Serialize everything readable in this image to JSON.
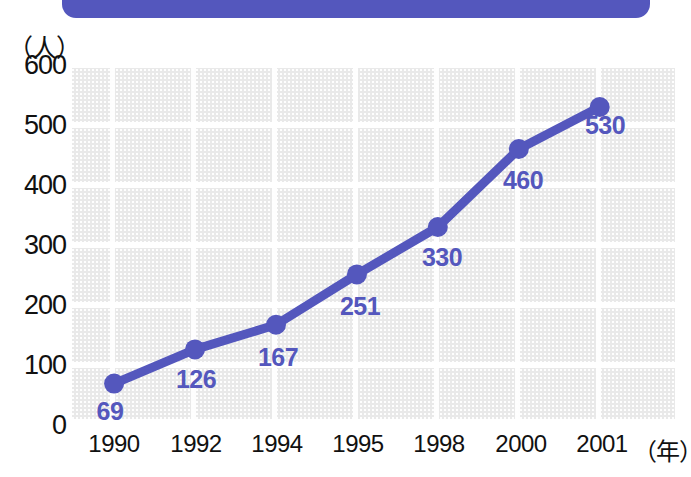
{
  "banner": {
    "name": "header-bar",
    "color": "#5457bd"
  },
  "axes": {
    "y_unit": "（人）",
    "x_unit": "（年）",
    "y_ticks": [
      "600",
      "500",
      "400",
      "300",
      "200",
      "100",
      "0"
    ],
    "x_ticks": [
      "1990",
      "1992",
      "1994",
      "1995",
      "1998",
      "2000",
      "2001"
    ]
  },
  "chart_data": {
    "type": "line",
    "title": "",
    "xlabel": "（年）",
    "ylabel": "（人）",
    "categories": [
      "1990",
      "1992",
      "1994",
      "1995",
      "1998",
      "2000",
      "2001"
    ],
    "values": [
      69,
      126,
      167,
      251,
      330,
      460,
      530
    ],
    "point_labels": [
      "69",
      "126",
      "167",
      "251",
      "330",
      "460",
      "530"
    ],
    "ylim": [
      0,
      600
    ],
    "ytick_values": [
      0,
      100,
      200,
      300,
      400,
      500,
      600
    ],
    "grid": true,
    "legend": "none",
    "series_color": "#5457bd",
    "marker": "circle",
    "plot_background": "#e9e9e9"
  }
}
